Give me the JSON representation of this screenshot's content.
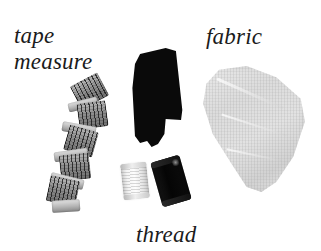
{
  "figure": {
    "background_color": "#ffffff",
    "width": 321,
    "height": 251,
    "ink_color": "#1b1b1b"
  },
  "labels": {
    "tape": "tape",
    "measure": "measure",
    "fabric": "fabric",
    "thread": "thread"
  },
  "objects": [
    {
      "name": "tape-measure",
      "label": "tape measure",
      "description": "coiled cloth tape measure ribbon, zig-zag folded",
      "color": "#8e8e8e"
    },
    {
      "name": "black-cloth",
      "label": "",
      "description": "solid black irregular cloth piece with notched lower edge",
      "color": "#0a0a0a"
    },
    {
      "name": "fabric-swatch",
      "label": "fabric",
      "description": "light gray woven fabric swatch, slightly rotated quadrilateral",
      "color": "#dcdcdc"
    },
    {
      "name": "spool-white",
      "label": "thread",
      "description": "light thread spool with horizontal winding lines",
      "color": "#f4f4f4"
    },
    {
      "name": "spool-dark",
      "label": "thread",
      "description": "dark thread spool, tilted",
      "color": "#0a0a0a"
    }
  ]
}
